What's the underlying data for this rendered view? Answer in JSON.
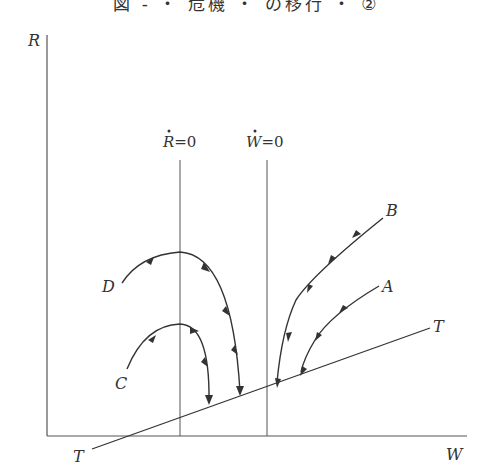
{
  "title": "図 - ・ 危機 ・ の移行 ・ ②",
  "axes": {
    "y_label": "R",
    "x_label": "W"
  },
  "nullclines": [
    {
      "var": "R",
      "label_rest": "=0"
    },
    {
      "var": "W",
      "label_rest": "=0"
    }
  ],
  "line": {
    "label_start": "T",
    "label_end": "T"
  },
  "paths": [
    {
      "name": "A",
      "label": "A"
    },
    {
      "name": "B",
      "label": "B"
    },
    {
      "name": "C",
      "label": "C"
    },
    {
      "name": "D",
      "label": "D"
    }
  ],
  "colors": {
    "line": "#333333",
    "axis": "#555555"
  }
}
